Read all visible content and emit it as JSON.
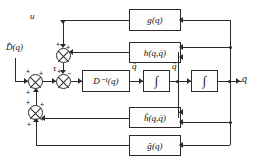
{
  "diagram": {
    "line_color": "#2a2a2a",
    "block_fill": "#fdfdfd"
  },
  "blocks": {
    "gravity_feedback": "g(q)",
    "coriolis_feedback": "h(q,q̇)",
    "inertia_inverse": "D⁻¹(q)",
    "integrator_1": "∫",
    "integrator_2": "∫",
    "coriolis_estimate": "ĥ(q,q̇)",
    "gravity_estimate": "ĝ(q)"
  },
  "signals": {
    "input_u": "u",
    "inertia_estimate": "D̂(q)",
    "torque": "τ",
    "accel": "q̈",
    "velocity": "q̇",
    "position": "q",
    "output": "q"
  },
  "signs": {
    "plus": "+",
    "minus": "−"
  },
  "summing_junctions": [
    {
      "name": "sum-top",
      "inputs": [
        "+",
        "+"
      ]
    },
    {
      "name": "sum-torque",
      "inputs": [
        "+",
        "−"
      ]
    },
    {
      "name": "sum-left",
      "inputs": [
        "+",
        "+"
      ]
    },
    {
      "name": "sum-bottom",
      "inputs": [
        "+",
        "+",
        "+"
      ]
    }
  ]
}
